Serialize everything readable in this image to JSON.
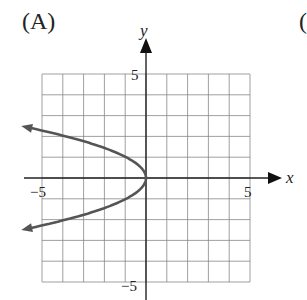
{
  "figure": {
    "panel_label": "(A)",
    "next_panel_label": "("
  },
  "chart_data": {
    "type": "line",
    "title": "(A)",
    "xlabel": "x",
    "ylabel": "y",
    "xlim": [
      -5,
      5
    ],
    "ylim": [
      -5,
      5
    ],
    "grid": true,
    "x_ticks_labeled": [
      "-5",
      "5"
    ],
    "y_ticks_labeled": [
      "5",
      "-5"
    ],
    "series": [
      {
        "name": "x = -y^2",
        "equation": "x = -y^2",
        "vertex": [
          0,
          0
        ],
        "opens": "left",
        "points": [
          [
            -6.25,
            2.5
          ],
          [
            -4,
            2
          ],
          [
            -1,
            1
          ],
          [
            0,
            0
          ],
          [
            -1,
            -1
          ],
          [
            -4,
            -2
          ],
          [
            -6.25,
            -2.5
          ]
        ],
        "arrows_at_ends": true,
        "color": "#555555"
      }
    ]
  },
  "labels": {
    "x_axis": "x",
    "y_axis": "y",
    "x_min": "−5",
    "x_max": "5",
    "y_max": "5",
    "y_min": "−5"
  }
}
